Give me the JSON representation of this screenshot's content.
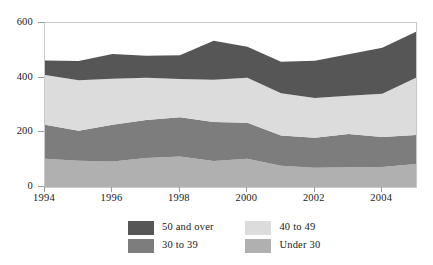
{
  "chart_data": {
    "type": "area",
    "stacked": true,
    "title": "",
    "subtitle": "",
    "xlabel": "",
    "ylabel": "",
    "xlim": [
      1994,
      2005
    ],
    "ylim": [
      0,
      600
    ],
    "grid": false,
    "legend_position": "bottom",
    "x": [
      1994,
      1995,
      1996,
      1997,
      1998,
      1999,
      2000,
      2001,
      2002,
      2003,
      2004,
      2005
    ],
    "xticks": [
      1994,
      1996,
      1998,
      2000,
      2002,
      2004
    ],
    "xtick_labels": [
      "1994",
      "1996",
      "1998",
      "2000",
      "2002",
      "2004"
    ],
    "yticks": [
      0,
      200,
      400,
      600
    ],
    "ytick_labels": [
      "0",
      "200",
      "400",
      "600"
    ],
    "series": [
      {
        "name": "Under 30",
        "color": "#b0b0b0",
        "values": [
          103,
          96,
          93,
          106,
          112,
          95,
          103,
          78,
          70,
          72,
          73,
          84
        ]
      },
      {
        "name": "30 to 39",
        "color": "#7d7d7d",
        "values": [
          125,
          110,
          135,
          139,
          143,
          143,
          132,
          110,
          110,
          122,
          110,
          106
        ]
      },
      {
        "name": "40 to 49",
        "color": "#dcdcdc",
        "values": [
          182,
          185,
          168,
          155,
          140,
          154,
          165,
          155,
          146,
          140,
          158,
          210
        ]
      },
      {
        "name": "50 and over",
        "color": "#565656",
        "values": [
          53,
          70,
          91,
          80,
          87,
          143,
          113,
          115,
          136,
          152,
          168,
          168
        ]
      }
    ],
    "stack_order_bottom_to_top": [
      "Under 30",
      "30 to 39",
      "40 to 49",
      "50 and over"
    ],
    "totals": [
      463,
      461,
      487,
      480,
      482,
      535,
      513,
      458,
      462,
      486,
      509,
      568
    ]
  },
  "legend": {
    "entries": [
      {
        "label": "50 and over",
        "color": "#565656"
      },
      {
        "label": "40 to 49",
        "color": "#dcdcdc"
      },
      {
        "label": "30 to 39",
        "color": "#7d7d7d"
      },
      {
        "label": "Under 30",
        "color": "#b0b0b0"
      }
    ]
  },
  "axes": {
    "frame_color": "#c9c9c9",
    "tick_color": "#9a9a9a"
  }
}
